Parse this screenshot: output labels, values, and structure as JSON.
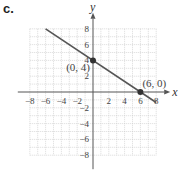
{
  "part_label": "c.",
  "chart_data": {
    "type": "line",
    "title": "",
    "xlabel": "x",
    "ylabel": "y",
    "xlim": [
      -8,
      8
    ],
    "ylim": [
      -8,
      8
    ],
    "grid": true,
    "x_ticks": [
      -8,
      -6,
      -4,
      -2,
      2,
      4,
      6,
      8
    ],
    "y_ticks": [
      8,
      6,
      4,
      2,
      -2,
      -4,
      -6,
      -8
    ],
    "series": [
      {
        "name": "line",
        "equation": "y = -2/3 x + 4",
        "x": [
          -6,
          8
        ],
        "y": [
          8,
          -1.33
        ]
      }
    ],
    "points": [
      {
        "label": "(0, 4)",
        "x": 0,
        "y": 4
      },
      {
        "label": "(6, 0)",
        "x": 6,
        "y": 0
      }
    ],
    "colors": {
      "line": "#555555",
      "grid": "#cccccc",
      "axis": "#555555",
      "point": "#333333"
    }
  }
}
